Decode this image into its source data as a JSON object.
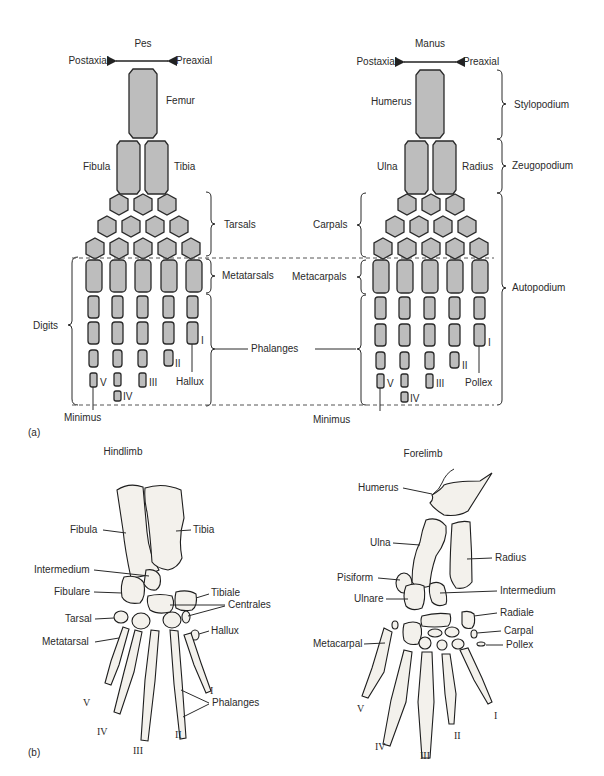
{
  "figure": {
    "part_a_label": "(a)",
    "part_b_label": "(b)",
    "part_a": {
      "pes": {
        "title": "Pes",
        "axis_left": "Postaxial",
        "axis_right": "Preaxial",
        "labels": {
          "femur": "Femur",
          "fibula": "Fibula",
          "tibia": "Tibia",
          "tarsals": "Tarsals",
          "metatarsals": "Metatarsals",
          "digits": "Digits",
          "hallux": "Hallux",
          "minimus": "Minimus"
        },
        "digit_numerals": [
          "I",
          "II",
          "III",
          "IV",
          "V"
        ]
      },
      "manus": {
        "title": "Manus",
        "axis_left": "Postaxial",
        "axis_right": "Preaxial",
        "labels": {
          "humerus": "Humerus",
          "ulna": "Ulna",
          "radius": "Radius",
          "carpals": "Carpals",
          "metacarpals": "Metacarpals",
          "pollex": "Pollex",
          "minimus": "Minimus"
        },
        "digit_numerals": [
          "I",
          "II",
          "III",
          "IV",
          "V"
        ]
      },
      "shared": {
        "phalanges": "Phalanges",
        "stylopodium": "Stylopodium",
        "zeugopodium": "Zeugopodium",
        "autopodium": "Autopodium"
      }
    },
    "part_b": {
      "hindlimb": {
        "title": "Hindlimb",
        "labels": {
          "fibula": "Fibula",
          "tibia": "Tibia",
          "intermedium": "Intermedium",
          "fibulare": "Fibulare",
          "tibiale": "Tibiale",
          "centrales": "Centrales",
          "tarsal": "Tarsal",
          "hallux": "Hallux",
          "metatarsal": "Metatarsal",
          "phalanges": "Phalanges"
        },
        "digit_numerals": [
          "I",
          "II",
          "III",
          "IV",
          "V"
        ]
      },
      "forelimb": {
        "title": "Forelimb",
        "labels": {
          "humerus": "Humerus",
          "ulna": "Ulna",
          "radius": "Radius",
          "pisiform": "Pisiform",
          "intermedium": "Intermedium",
          "ulnare": "Ulnare",
          "radiale": "Radiale",
          "carpal": "Carpal",
          "pollex": "Pollex",
          "metacarpal": "Metacarpal"
        },
        "digit_numerals": [
          "I",
          "II",
          "III",
          "IV",
          "V"
        ]
      }
    }
  },
  "colors": {
    "bone_fill": "#bdbdbd",
    "outline": "#2a2a2a",
    "background": "#ffffff"
  }
}
